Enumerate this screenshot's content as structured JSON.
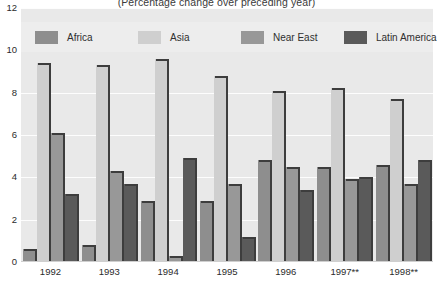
{
  "chart_data": {
    "type": "bar",
    "title": "(Percentage change over preceding year)",
    "xlabel": "",
    "ylabel": "",
    "ylim": [
      0,
      12
    ],
    "yticks": [
      0,
      2,
      4,
      6,
      8,
      10,
      12
    ],
    "grid": true,
    "legend_position": "top-inside",
    "categories": [
      "1992",
      "1993",
      "1994",
      "1995",
      "1996",
      "1997**",
      "1998**"
    ],
    "series": [
      {
        "name": "Africa",
        "color": "#8e8e8e",
        "values": [
          0.6,
          0.8,
          2.9,
          2.9,
          4.8,
          4.5,
          4.6
        ]
      },
      {
        "name": "Asia",
        "color": "#cfcfcf",
        "values": [
          9.4,
          9.3,
          9.6,
          8.8,
          8.1,
          8.2,
          7.7
        ]
      },
      {
        "name": "Near East",
        "color": "#989898",
        "values": [
          6.1,
          4.3,
          0.3,
          3.7,
          4.5,
          3.9,
          3.7
        ]
      },
      {
        "name": "Latin America",
        "color": "#5a5a5a",
        "values": [
          3.2,
          3.7,
          4.9,
          1.2,
          3.4,
          4.0,
          4.8
        ]
      }
    ]
  },
  "axis": {
    "y_labels": [
      "12",
      "10",
      "8",
      "6",
      "4",
      "2",
      "0"
    ]
  },
  "colors": {
    "plot_background": "#e9e9e9",
    "legend_background": "#ededed",
    "gridline": "#fdfdfd",
    "text": "#2b2b2b",
    "bar_edge": "#3d3d3d"
  }
}
